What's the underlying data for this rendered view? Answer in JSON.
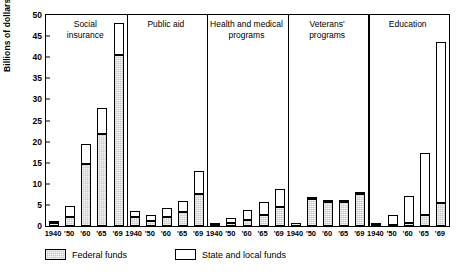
{
  "chart_data": {
    "type": "bar",
    "title": "",
    "subtitle": "",
    "xlabel": "",
    "ylabel": "Billions of dollars",
    "ylim": [
      0,
      50
    ],
    "yticks": [
      0,
      5,
      10,
      15,
      20,
      25,
      30,
      35,
      40,
      45,
      50
    ],
    "grid": false,
    "stacked": true,
    "legend_position": "bottom-left",
    "legend": [
      "Federal funds",
      "State and local funds"
    ],
    "categories": [
      "1940",
      "'50",
      "'60",
      "'65",
      "'69"
    ],
    "series": [
      {
        "name": "Federal funds",
        "color": "#c9c9c9"
      },
      {
        "name": "State and local funds",
        "color": "#ffffff"
      }
    ],
    "groups": [
      {
        "name": "Social insurance",
        "label_lines": [
          "Social",
          "insurance"
        ],
        "bars": [
          {
            "x": "1940",
            "federal": 0.8,
            "state_local": 0.5,
            "total": 1.3
          },
          {
            "x": "'50",
            "federal": 2.1,
            "state_local": 2.6,
            "total": 4.7
          },
          {
            "x": "'60",
            "federal": 14.6,
            "state_local": 4.9,
            "total": 19.5
          },
          {
            "x": "'65",
            "federal": 21.8,
            "state_local": 6.2,
            "total": 28.0
          },
          {
            "x": "'69",
            "federal": 40.6,
            "state_local": 7.4,
            "total": 48.0
          }
        ]
      },
      {
        "name": "Public aid",
        "label_lines": [
          "Public aid"
        ],
        "bars": [
          {
            "x": "1940",
            "federal": 2.1,
            "state_local": 1.4,
            "total": 3.5
          },
          {
            "x": "'50",
            "federal": 1.2,
            "state_local": 1.3,
            "total": 2.5
          },
          {
            "x": "'60",
            "federal": 2.1,
            "state_local": 2.1,
            "total": 4.2
          },
          {
            "x": "'65",
            "federal": 3.4,
            "state_local": 2.6,
            "total": 6.0
          },
          {
            "x": "'69",
            "federal": 7.6,
            "state_local": 5.4,
            "total": 13.0
          }
        ]
      },
      {
        "name": "Health and medical programs",
        "label_lines": [
          "Health and medical",
          "programs"
        ],
        "bars": [
          {
            "x": "1940",
            "federal": 0.3,
            "state_local": 0.4,
            "total": 0.7
          },
          {
            "x": "'50",
            "federal": 0.8,
            "state_local": 1.2,
            "total": 2.0
          },
          {
            "x": "'60",
            "federal": 1.4,
            "state_local": 2.5,
            "total": 3.9
          },
          {
            "x": "'65",
            "federal": 2.5,
            "state_local": 3.3,
            "total": 5.8
          },
          {
            "x": "'69",
            "federal": 4.6,
            "state_local": 4.2,
            "total": 8.8
          }
        ]
      },
      {
        "name": "Veterans' programs",
        "label_lines": [
          "Veterans'",
          "programs"
        ],
        "bars": [
          {
            "x": "1940",
            "federal": 0.6,
            "state_local": 0.0,
            "total": 0.6
          },
          {
            "x": "'50",
            "federal": 6.4,
            "state_local": 0.2,
            "total": 6.6
          },
          {
            "x": "'60",
            "federal": 5.8,
            "state_local": 0.1,
            "total": 5.9
          },
          {
            "x": "'65",
            "federal": 5.8,
            "state_local": 0.1,
            "total": 5.9
          },
          {
            "x": "'69",
            "federal": 7.6,
            "state_local": 0.2,
            "total": 7.8
          }
        ]
      },
      {
        "name": "Education",
        "label_lines": [
          "Education"
        ],
        "bars": [
          {
            "x": "1940",
            "federal": 0.1,
            "state_local": 0.7,
            "total": 0.8
          },
          {
            "x": "'50",
            "federal": 0.2,
            "state_local": 2.3,
            "total": 2.5
          },
          {
            "x": "'60",
            "federal": 0.7,
            "state_local": 6.3,
            "total": 7.0
          },
          {
            "x": "'65",
            "federal": 2.6,
            "state_local": 14.6,
            "total": 17.2
          },
          {
            "x": "'69",
            "federal": 5.4,
            "state_local": 38.1,
            "total": 43.5
          }
        ]
      }
    ]
  }
}
